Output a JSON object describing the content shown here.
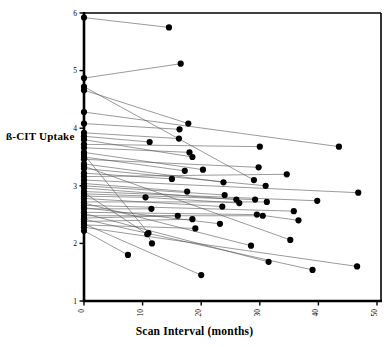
{
  "chart_data": {
    "type": "scatter",
    "title": "",
    "xlabel": "Scan Interval (months)",
    "ylabel": "ß-CIT  Uptake",
    "xlim": [
      0,
      50
    ],
    "ylim": [
      1,
      6
    ],
    "xticks": [
      0,
      10,
      20,
      30,
      40,
      50
    ],
    "xticklabels": [
      "0",
      "10",
      "20",
      "30",
      "40",
      "50"
    ],
    "yticks": [
      1,
      2,
      3,
      4,
      5,
      6
    ],
    "yticklabels": [
      "1",
      "2",
      "3",
      "4",
      "5",
      "6"
    ],
    "grid": false,
    "legend": null,
    "marker": "filled-circle",
    "marker_color": "#000000",
    "line_color": "#555555",
    "xtick_label_rotation": 90,
    "series": [
      {
        "name": "subject-01",
        "points": [
          [
            0,
            5.92
          ],
          [
            14.5,
            5.75
          ]
        ]
      },
      {
        "name": "subject-02",
        "points": [
          [
            0,
            4.87
          ],
          [
            16.5,
            5.12
          ]
        ]
      },
      {
        "name": "subject-03",
        "points": [
          [
            0,
            4.72
          ],
          [
            29.0,
            3.1
          ]
        ]
      },
      {
        "name": "subject-04",
        "points": [
          [
            0,
            4.66
          ],
          [
            17.8,
            4.08
          ]
        ]
      },
      {
        "name": "subject-05",
        "points": [
          [
            0,
            4.28
          ],
          [
            43.5,
            3.68
          ]
        ]
      },
      {
        "name": "subject-06",
        "points": [
          [
            0,
            4.08
          ],
          [
            16.3,
            3.98
          ]
        ]
      },
      {
        "name": "subject-07",
        "points": [
          [
            0,
            3.92
          ],
          [
            16.2,
            3.82
          ]
        ]
      },
      {
        "name": "subject-08",
        "points": [
          [
            0,
            3.86
          ],
          [
            11.2,
            3.76
          ]
        ]
      },
      {
        "name": "subject-09",
        "points": [
          [
            0,
            3.8
          ],
          [
            18.5,
            3.5
          ]
        ]
      },
      {
        "name": "subject-10",
        "points": [
          [
            0,
            3.72
          ],
          [
            30.0,
            3.68
          ]
        ]
      },
      {
        "name": "subject-11",
        "points": [
          [
            0,
            3.66
          ],
          [
            18.0,
            3.58
          ]
        ]
      },
      {
        "name": "subject-12",
        "points": [
          [
            0,
            3.58
          ],
          [
            20.3,
            3.28
          ]
        ]
      },
      {
        "name": "subject-13",
        "points": [
          [
            0,
            3.5
          ],
          [
            17.2,
            3.26
          ]
        ]
      },
      {
        "name": "subject-14",
        "points": [
          [
            0,
            3.46
          ],
          [
            29.8,
            3.32
          ]
        ]
      },
      {
        "name": "subject-15",
        "points": [
          [
            0,
            3.38
          ],
          [
            23.8,
            3.06
          ]
        ]
      },
      {
        "name": "subject-16",
        "points": [
          [
            0,
            3.3
          ],
          [
            31.0,
            3.0
          ]
        ]
      },
      {
        "name": "subject-17",
        "points": [
          [
            0,
            3.22
          ],
          [
            15.0,
            3.12
          ]
        ]
      },
      {
        "name": "subject-18",
        "points": [
          [
            0,
            3.16
          ],
          [
            34.6,
            3.2
          ]
        ]
      },
      {
        "name": "subject-19",
        "points": [
          [
            0,
            3.1
          ],
          [
            46.8,
            2.88
          ]
        ]
      },
      {
        "name": "subject-20",
        "points": [
          [
            0,
            3.04
          ],
          [
            17.6,
            2.9
          ]
        ]
      },
      {
        "name": "subject-21",
        "points": [
          [
            0,
            3.0
          ],
          [
            24.0,
            2.84
          ]
        ]
      },
      {
        "name": "subject-22",
        "points": [
          [
            0,
            2.96
          ],
          [
            26.0,
            2.76
          ]
        ]
      },
      {
        "name": "subject-23",
        "points": [
          [
            0,
            2.9
          ],
          [
            39.8,
            2.74
          ]
        ]
      },
      {
        "name": "subject-24",
        "points": [
          [
            0,
            2.86
          ],
          [
            29.2,
            2.76
          ]
        ]
      },
      {
        "name": "subject-25",
        "points": [
          [
            0,
            2.82
          ],
          [
            10.5,
            2.8
          ],
          [
            26.5,
            2.7
          ]
        ]
      },
      {
        "name": "subject-26",
        "points": [
          [
            0,
            2.78
          ],
          [
            23.6,
            2.64
          ]
        ]
      },
      {
        "name": "subject-27",
        "points": [
          [
            0,
            2.72
          ],
          [
            31.2,
            2.72
          ]
        ]
      },
      {
        "name": "subject-28",
        "points": [
          [
            0,
            2.66
          ],
          [
            35.8,
            2.56
          ]
        ]
      },
      {
        "name": "subject-29",
        "points": [
          [
            0,
            2.6
          ],
          [
            11.5,
            2.6
          ]
        ]
      },
      {
        "name": "subject-30",
        "points": [
          [
            0,
            2.54
          ],
          [
            29.5,
            2.5
          ],
          [
            36.6,
            2.4
          ]
        ]
      },
      {
        "name": "subject-31",
        "points": [
          [
            0,
            2.48
          ],
          [
            30.5,
            2.48
          ]
        ]
      },
      {
        "name": "subject-32",
        "points": [
          [
            0,
            2.44
          ],
          [
            16.0,
            2.48
          ]
        ]
      },
      {
        "name": "subject-33",
        "points": [
          [
            0,
            2.38
          ],
          [
            18.5,
            2.42
          ]
        ]
      },
      {
        "name": "subject-34",
        "points": [
          [
            0,
            2.32
          ],
          [
            19.0,
            2.26
          ]
        ]
      },
      {
        "name": "subject-35",
        "points": [
          [
            0,
            2.22
          ],
          [
            7.5,
            1.8
          ]
        ]
      },
      {
        "name": "subject-36",
        "points": [
          [
            0,
            2.62
          ],
          [
            23.2,
            2.34
          ]
        ]
      },
      {
        "name": "subject-37",
        "points": [
          [
            0,
            3.34
          ],
          [
            35.2,
            2.06
          ]
        ]
      },
      {
        "name": "subject-38",
        "points": [
          [
            0,
            2.88
          ],
          [
            10.8,
            2.16
          ],
          [
            11.6,
            2.0
          ]
        ]
      },
      {
        "name": "subject-39",
        "points": [
          [
            0,
            2.7
          ],
          [
            28.5,
            1.96
          ]
        ]
      },
      {
        "name": "subject-40",
        "points": [
          [
            0,
            2.52
          ],
          [
            31.5,
            1.68
          ]
        ]
      },
      {
        "name": "subject-41",
        "points": [
          [
            0,
            2.42
          ],
          [
            39.0,
            1.54
          ]
        ]
      },
      {
        "name": "subject-42",
        "points": [
          [
            0,
            2.34
          ],
          [
            20.0,
            1.45
          ]
        ]
      },
      {
        "name": "subject-43",
        "points": [
          [
            0,
            2.28
          ],
          [
            46.6,
            1.6
          ]
        ]
      },
      {
        "name": "subject-44",
        "points": [
          [
            0,
            3.54
          ],
          [
            11.0,
            2.18
          ]
        ]
      }
    ]
  }
}
